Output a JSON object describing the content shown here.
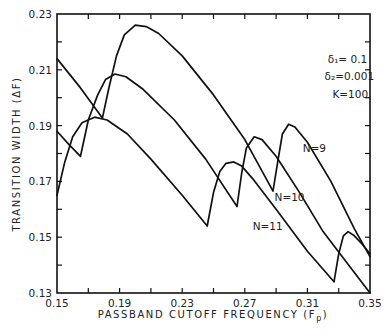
{
  "chart_data": {
    "type": "line",
    "title": "",
    "xlabel": "PASSBAND CUTOFF FREQUENCY (F",
    "xlabel_sub": "p",
    "xlabel_end": ")",
    "ylabel": "TRANSITION WIDTH (ΔF)",
    "xlim": [
      0.15,
      0.35
    ],
    "ylim": [
      0.13,
      0.23
    ],
    "x_ticks": [
      0.15,
      0.19,
      0.23,
      0.27,
      0.31,
      0.35
    ],
    "x_tick_labels": [
      "0.15",
      "0.19",
      "0.23",
      "0.27",
      "0.31",
      "0.35"
    ],
    "x_minor_ticks": [
      0.17,
      0.21,
      0.25,
      0.29,
      0.33
    ],
    "y_ticks": [
      0.13,
      0.15,
      0.17,
      0.19,
      0.21,
      0.23
    ],
    "y_tick_labels": [
      "0.13",
      "0.15",
      "0.17",
      "0.19",
      "0.21",
      "0.23"
    ],
    "y_minor_ticks": [
      0.14,
      0.16,
      0.18,
      0.2,
      0.22
    ],
    "grid": false,
    "legend": "inline labels",
    "annotations": [
      {
        "text": "δ₁= 0.1",
        "x": 0.323,
        "y": 0.2125
      },
      {
        "text": "δ₂=0.001",
        "x": 0.321,
        "y": 0.2062
      },
      {
        "text": "K=100",
        "x": 0.326,
        "y": 0.2
      }
    ],
    "series": [
      {
        "name": "N=9",
        "label_pos": {
          "x": 0.307,
          "y": 0.1805
        },
        "points": [
          [
            0.15,
            0.214
          ],
          [
            0.165,
            0.2035
          ],
          [
            0.179,
            0.1927
          ],
          [
            0.183,
            0.203
          ],
          [
            0.188,
            0.215
          ],
          [
            0.193,
            0.2225
          ],
          [
            0.2,
            0.226
          ],
          [
            0.207,
            0.2255
          ],
          [
            0.215,
            0.223
          ],
          [
            0.23,
            0.215
          ],
          [
            0.25,
            0.201
          ],
          [
            0.27,
            0.185
          ],
          [
            0.288,
            0.1665
          ],
          [
            0.291,
            0.177
          ],
          [
            0.294,
            0.187
          ],
          [
            0.298,
            0.1905
          ],
          [
            0.302,
            0.1895
          ],
          [
            0.31,
            0.184
          ],
          [
            0.325,
            0.17
          ],
          [
            0.34,
            0.153
          ],
          [
            0.35,
            0.143
          ]
        ]
      },
      {
        "name": "N=10",
        "label_pos": {
          "x": 0.289,
          "y": 0.163
        },
        "points": [
          [
            0.15,
            0.188
          ],
          [
            0.158,
            0.183
          ],
          [
            0.165,
            0.179
          ],
          [
            0.17,
            0.192
          ],
          [
            0.176,
            0.201
          ],
          [
            0.181,
            0.2065
          ],
          [
            0.187,
            0.2085
          ],
          [
            0.194,
            0.2075
          ],
          [
            0.205,
            0.203
          ],
          [
            0.225,
            0.192
          ],
          [
            0.245,
            0.178
          ],
          [
            0.265,
            0.161
          ],
          [
            0.268,
            0.173
          ],
          [
            0.271,
            0.182
          ],
          [
            0.276,
            0.186
          ],
          [
            0.281,
            0.185
          ],
          [
            0.29,
            0.179
          ],
          [
            0.305,
            0.166
          ],
          [
            0.32,
            0.152
          ],
          [
            0.335,
            0.141
          ],
          [
            0.35,
            0.13
          ]
        ]
      },
      {
        "name": "N=11",
        "label_pos": {
          "x": 0.275,
          "y": 0.1525
        },
        "points": [
          [
            0.15,
            0.165
          ],
          [
            0.155,
            0.177
          ],
          [
            0.16,
            0.186
          ],
          [
            0.166,
            0.191
          ],
          [
            0.174,
            0.193
          ],
          [
            0.182,
            0.192
          ],
          [
            0.195,
            0.187
          ],
          [
            0.21,
            0.178
          ],
          [
            0.23,
            0.165
          ],
          [
            0.246,
            0.154
          ],
          [
            0.25,
            0.166
          ],
          [
            0.254,
            0.1735
          ],
          [
            0.258,
            0.1765
          ],
          [
            0.263,
            0.177
          ],
          [
            0.268,
            0.1755
          ],
          [
            0.275,
            0.171
          ],
          [
            0.29,
            0.16
          ],
          [
            0.31,
            0.145
          ],
          [
            0.327,
            0.134
          ],
          [
            0.33,
            0.144
          ],
          [
            0.333,
            0.1505
          ],
          [
            0.336,
            0.152
          ],
          [
            0.34,
            0.1505
          ],
          [
            0.345,
            0.1475
          ],
          [
            0.35,
            0.144
          ]
        ]
      }
    ]
  }
}
